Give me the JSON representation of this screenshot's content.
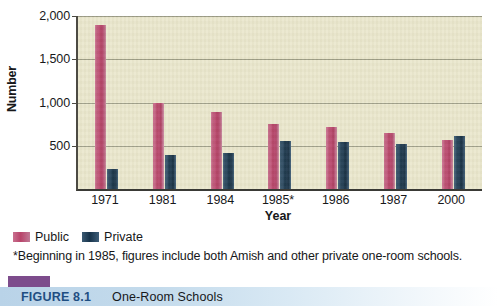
{
  "chart_data": {
    "type": "bar",
    "title": "One-Room Schools",
    "xlabel": "Year",
    "ylabel": "Number",
    "ylim": [
      0,
      2000
    ],
    "yticks": [
      500,
      1000,
      1500,
      2000
    ],
    "ytick_labels": [
      "500",
      "1,000",
      "1,500",
      "2,000"
    ],
    "grid": true,
    "legend_position": "below-left",
    "categories": [
      "1971",
      "1981",
      "1984",
      "1985*",
      "1986",
      "1987",
      "2000"
    ],
    "series": [
      {
        "name": "Public",
        "color": "#b8446a",
        "values": [
          1900,
          995,
          890,
          750,
          715,
          645,
          570
        ]
      },
      {
        "name": "Private",
        "color": "#17334a",
        "values": [
          230,
          390,
          420,
          560,
          540,
          520,
          615
        ]
      }
    ],
    "annotations": [
      "*Beginning in 1985, figures include both Amish and other private one-room schools."
    ]
  },
  "axes": {
    "y_title": "Number",
    "x_title": "Year"
  },
  "legend": {
    "items": [
      {
        "label": "Public"
      },
      {
        "label": "Private"
      }
    ]
  },
  "footnote": {
    "text": "*Beginning in 1985, figures include both Amish and other private one-room schools."
  },
  "caption": {
    "figure_number": "FIGURE 8.1",
    "title": "One-Room Schools"
  }
}
